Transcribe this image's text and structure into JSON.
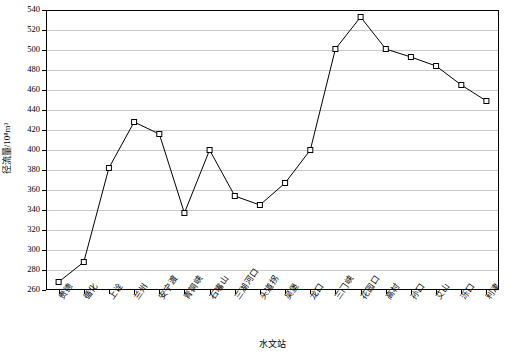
{
  "chart_data": {
    "type": "line",
    "title": "",
    "xlabel": "水文站",
    "ylabel": "径流量/10⁸m³",
    "categories": [
      "贵德",
      "循化",
      "上诠",
      "兰州",
      "安宁渡",
      "青铜峡",
      "石嘴山",
      "三湖河口",
      "头道拐",
      "吴堡",
      "龙口",
      "三门峡",
      "花园口",
      "高村",
      "孙口",
      "艾山",
      "泺口",
      "利津"
    ],
    "values": [
      268,
      288,
      382,
      428,
      416,
      337,
      400,
      354,
      345,
      367,
      400,
      501,
      533,
      501,
      493,
      484,
      465,
      449
    ],
    "ylim": [
      260,
      540
    ],
    "ytick_step": 20,
    "yticks": [
      260,
      280,
      300,
      320,
      340,
      360,
      380,
      400,
      420,
      440,
      460,
      480,
      500,
      520,
      540
    ],
    "grid": true,
    "legend": "none",
    "marker": "open-square",
    "line_color": "#000000",
    "grid_color": "#c9c9c9"
  }
}
